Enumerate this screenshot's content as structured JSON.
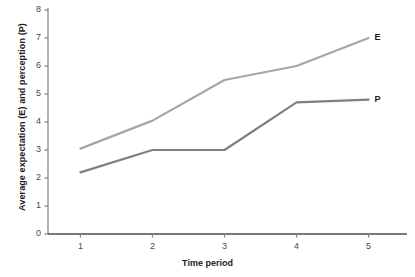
{
  "chart_data": {
    "type": "line",
    "title": "",
    "xlabel": "Time period",
    "ylabel": "Average expectation (E) and perception (P)",
    "categories": [
      "1",
      "2",
      "3",
      "4",
      "5"
    ],
    "x": [
      1,
      2,
      3,
      4,
      5
    ],
    "xlim": [
      0.55,
      5.45
    ],
    "ylim": [
      0,
      8
    ],
    "yticks": [
      "0",
      "1",
      "2",
      "3",
      "4",
      "5",
      "6",
      "7",
      "8"
    ],
    "ytick_values": [
      0,
      1,
      2,
      3,
      4,
      5,
      6,
      7,
      8
    ],
    "grid": false,
    "legend": "inline-end-labels",
    "series": [
      {
        "name": "E",
        "label": "E",
        "color": "#a6a6a6",
        "values": [
          3.05,
          4.05,
          5.5,
          6.0,
          7.0
        ]
      },
      {
        "name": "P",
        "label": "P",
        "color": "#808080",
        "values": [
          2.2,
          3.0,
          3.0,
          4.7,
          4.8
        ]
      }
    ],
    "axis_color": "#808080"
  }
}
